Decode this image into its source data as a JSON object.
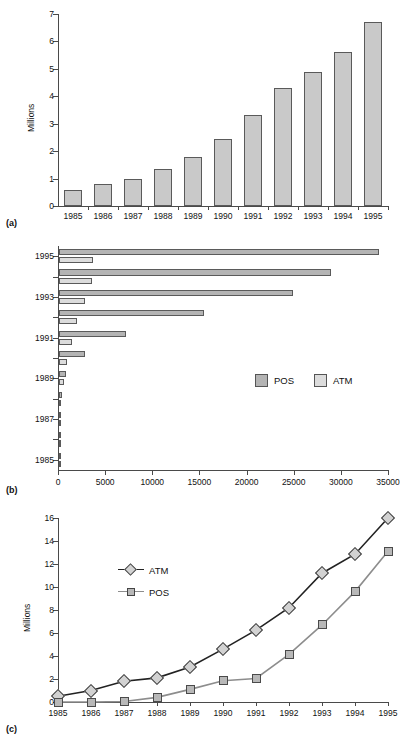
{
  "figure": {
    "panel_a_label": "(a)",
    "panel_b_label": "(b)",
    "panel_c_label": "(c)"
  },
  "colors": {
    "pos_fill": "#b4b4b4",
    "atm_fill": "#dcdcdc",
    "bar_fill": "#c9c9c9",
    "bar_stroke": "#5a5a5a",
    "axis": "#4a4a4a",
    "atm_line": "#222222",
    "pos_line": "#8d8d8d"
  },
  "chart_data": [
    {
      "type": "bar",
      "panel": "(a)",
      "title": "",
      "xlabel": "",
      "ylabel": "Millions",
      "categories": [
        "1985",
        "1986",
        "1987",
        "1988",
        "1989",
        "1990",
        "1991",
        "1992",
        "1993",
        "1994",
        "1995"
      ],
      "values": [
        0.57,
        0.8,
        1.0,
        1.35,
        1.8,
        2.45,
        3.3,
        4.3,
        4.9,
        5.6,
        6.7
      ],
      "ylim": [
        0,
        7
      ],
      "yticks": [
        0,
        1,
        2,
        3,
        4,
        5,
        6,
        7
      ],
      "grid": false,
      "legend": "none"
    },
    {
      "type": "bar",
      "orientation": "horizontal",
      "panel": "(b)",
      "title": "",
      "xlabel": "",
      "ylabel": "",
      "categories": [
        "1985",
        "1986",
        "1987",
        "1988",
        "1989",
        "1990",
        "1991",
        "1992",
        "1993",
        "1994",
        "1995"
      ],
      "series": [
        {
          "name": "POS",
          "values": [
            60,
            110,
            170,
            330,
            700,
            2800,
            7100,
            15400,
            24800,
            28900,
            33900
          ]
        },
        {
          "name": "ATM",
          "values": [
            40,
            80,
            130,
            260,
            520,
            880,
            1350,
            1950,
            2800,
            3450,
            3650
          ]
        }
      ],
      "xlim": [
        0,
        35000
      ],
      "xticks": [
        0,
        5000,
        10000,
        15000,
        20000,
        25000,
        30000,
        35000
      ],
      "xtick_labels": [
        "0",
        "5000",
        "10000",
        "15000",
        "20000",
        "25000",
        "30000",
        "35000"
      ],
      "ytick_labels": [
        "1985",
        "1987",
        "1989",
        "1991",
        "1993",
        "1995"
      ],
      "grid": false,
      "legend": "inside-right",
      "legend_entries": [
        "POS",
        "ATM"
      ]
    },
    {
      "type": "line",
      "panel": "(c)",
      "title": "",
      "xlabel": "",
      "ylabel": "Millions",
      "x": [
        "1985",
        "1986",
        "1987",
        "1988",
        "1989",
        "1990",
        "1991",
        "1992",
        "1993",
        "1994",
        "1995"
      ],
      "series": [
        {
          "name": "ATM",
          "marker": "diamond",
          "values": [
            0.5,
            1.0,
            1.8,
            2.1,
            3.05,
            4.6,
            6.25,
            8.2,
            11.2,
            12.85,
            16.0
          ]
        },
        {
          "name": "POS",
          "marker": "square",
          "values": [
            0.0,
            0.0,
            0.05,
            0.4,
            1.1,
            1.85,
            2.05,
            4.15,
            6.7,
            9.6,
            13.1
          ]
        }
      ],
      "ylim": [
        0,
        16
      ],
      "yticks": [
        0,
        2,
        4,
        6,
        8,
        10,
        12,
        14,
        16
      ],
      "grid": false,
      "legend": "inside-left",
      "legend_entries": [
        "ATM",
        "POS"
      ]
    }
  ]
}
